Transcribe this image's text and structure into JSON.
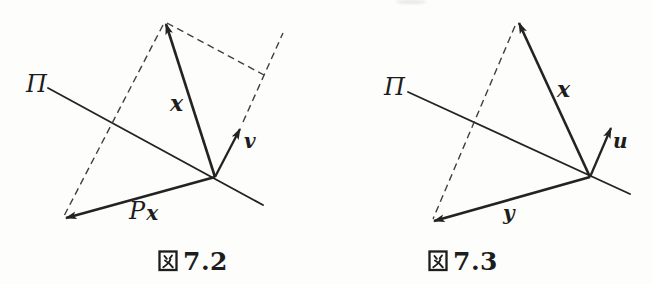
{
  "page": {
    "background": "#fdfdfc",
    "ink": "#232323",
    "description_of_content": "Two textbook vector-projection diagrams onto plane Pi"
  },
  "figure_left": {
    "caption": "図 7.2",
    "caption_number": "7.2",
    "plane_label": "Π",
    "vector_x_label": "x",
    "vector_v_label": "v",
    "projection_label_P": "P",
    "projection_label_x": "x"
  },
  "figure_right": {
    "caption": "図 7.3",
    "caption_number": "7.3",
    "plane_label": "Π",
    "vector_x_label": "x",
    "vector_u_label": "u",
    "vector_y_label": "y"
  }
}
